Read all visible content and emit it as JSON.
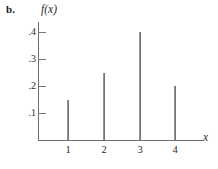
{
  "figure": {
    "part_label": "b.",
    "y_axis_label": "f(x)",
    "x_axis_label": "x"
  },
  "chart_data": {
    "type": "bar",
    "title": "",
    "subtitle": "",
    "xlabel": "x",
    "ylabel": "f(x)",
    "categories": [
      "1",
      "2",
      "3",
      "4"
    ],
    "x": [
      1,
      2,
      3,
      4
    ],
    "values": [
      0.15,
      0.25,
      0.4,
      0.2
    ],
    "xlim": [
      0,
      5
    ],
    "ylim": [
      0,
      0.45
    ],
    "ytick_labels": [
      ".1",
      ".2",
      ".3",
      ".4"
    ],
    "ytick_values": [
      0.1,
      0.2,
      0.3,
      0.4
    ],
    "xtick_labels": [
      "1",
      "2",
      "3",
      "4"
    ],
    "xtick_values": [
      1,
      2,
      3,
      4
    ],
    "grid": false,
    "legend": null,
    "style": "spike-plot",
    "colors": {
      "bar": "#7d7d7d",
      "axis": "#6e6e6e",
      "text": "#2a2a2a"
    }
  }
}
